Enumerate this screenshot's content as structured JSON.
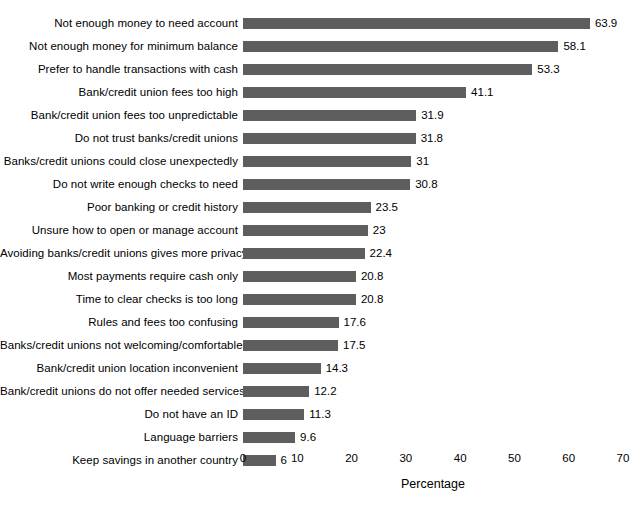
{
  "chart_data": {
    "type": "bar",
    "orientation": "horizontal",
    "title": "",
    "subtitle": "",
    "xlabel": "Percentage",
    "ylabel": "",
    "xlim": [
      0,
      70
    ],
    "xticks": [
      0,
      10,
      20,
      30,
      40,
      50,
      60,
      70
    ],
    "grid": false,
    "legend": null,
    "bar_color": "#5e5e5e",
    "show_value_labels": true,
    "categories": [
      "Not enough money to need account",
      "Not enough money for minimum balance",
      "Prefer to handle transactions with cash",
      "Bank/credit union fees too high",
      "Bank/credit union fees too unpredictable",
      "Do not trust banks/credit unions",
      "Banks/credit unions could close unexpectedly",
      "Do not write enough checks to need",
      "Poor banking or credit history",
      "Unsure how to open or manage account",
      "Avoiding banks/credit unions gives more privacy",
      "Most payments require cash only",
      "Time to clear checks is too long",
      "Rules and fees too confusing",
      "Banks/credit unions not welcoming/comfortable",
      "Bank/credit union location inconvenient",
      "Bank/credit unions do not offer needed services",
      "Do not have an ID",
      "Language barriers",
      "Keep savings in another country"
    ],
    "values": [
      63.9,
      58.1,
      53.3,
      41.1,
      31.9,
      31.8,
      31,
      30.8,
      23.5,
      23,
      22.4,
      20.8,
      20.8,
      17.6,
      17.5,
      14.3,
      12.2,
      11.3,
      9.6,
      6
    ],
    "value_labels": [
      "63.9",
      "58.1",
      "53.3",
      "41.1",
      "31.9",
      "31.8",
      "31",
      "30.8",
      "23.5",
      "23",
      "22.4",
      "20.8",
      "20.8",
      "17.6",
      "17.5",
      "14.3",
      "12.2",
      "11.3",
      "9.6",
      "6"
    ]
  }
}
